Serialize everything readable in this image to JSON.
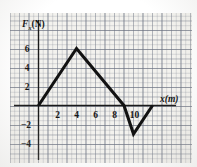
{
  "figure": {
    "background_color": "#f3f2ee",
    "grid_color": "#787e8c",
    "line_color": "#121212",
    "axis_color": "#1a1a1a"
  },
  "chart_data": {
    "type": "line",
    "title": "",
    "xlabel": "x(m)",
    "ylabel": "F",
    "ylabel_sub": "x",
    "ylabel_unit": "(N)",
    "ylabel_full": "Fx(N)",
    "xlim": [
      -1,
      14
    ],
    "ylim": [
      -5,
      7
    ],
    "grid": true,
    "legend": false,
    "xticks": [
      2,
      4,
      6,
      8,
      10
    ],
    "xticklabels": [
      "2",
      "4",
      "6",
      "8",
      "10"
    ],
    "yticks": [
      6,
      4,
      2,
      -2,
      -4
    ],
    "yticklabels": [
      "6",
      "4",
      "2",
      "−2",
      "−4"
    ],
    "series": [
      {
        "name": "Fx",
        "x": [
          0,
          4,
          9,
          10,
          12
        ],
        "y": [
          0,
          6,
          0,
          -3,
          0
        ]
      }
    ],
    "vertices": [
      {
        "label": "start",
        "x": 0,
        "y": 0
      },
      {
        "label": "peak",
        "x": 4,
        "y": 6
      },
      {
        "label": "zero-crossing",
        "x": 9,
        "y": 0
      },
      {
        "label": "minimum",
        "x": 10,
        "y": -3
      },
      {
        "label": "end",
        "x": 12,
        "y": 0
      }
    ]
  }
}
